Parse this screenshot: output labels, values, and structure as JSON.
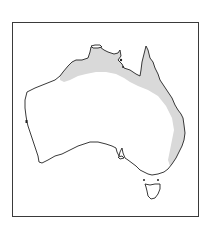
{
  "map": {
    "subject": "Australia distribution map",
    "frame": {
      "x": 12,
      "y": 22,
      "width": 187,
      "height": 195,
      "border_color": "#3a3a3a"
    },
    "colors": {
      "land": "#ffffff",
      "coastline": "#222222",
      "range_shading": "#d9d9d9",
      "background": "#ffffff"
    },
    "regions": [
      {
        "name": "mainland-australia",
        "type": "landmass"
      },
      {
        "name": "tasmania",
        "type": "landmass"
      },
      {
        "name": "distribution-range",
        "type": "shaded-area",
        "description": "Northern coast from Kimberley across Top End to Cape York and down the east coast"
      }
    ]
  }
}
